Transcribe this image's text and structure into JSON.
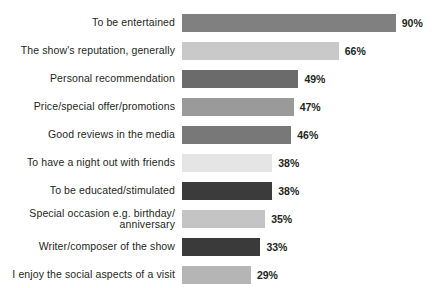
{
  "chart": {
    "title": "",
    "subtitle": "",
    "axis_suffix": "%"
  },
  "chart_data": {
    "type": "bar",
    "orientation": "horizontal",
    "title": "",
    "xlabel": "",
    "ylabel": "",
    "xlim": [
      0,
      100
    ],
    "grid": false,
    "legend": "none",
    "value_suffix": "%",
    "categories": [
      "To be entertained",
      "The show's reputation, generally",
      "Personal recommendation",
      "Price/special offer/promotions",
      "Good reviews in the media",
      "To have a night out with friends",
      "To be educated/stimulated",
      "Special occasion e.g. birthday/\nanniversary",
      "Writer/composer of the show",
      "I enjoy the social aspects of a visit"
    ],
    "values": [
      90,
      66,
      49,
      47,
      46,
      38,
      38,
      35,
      33,
      29
    ],
    "value_labels": [
      "90%",
      "66%",
      "49%",
      "47%",
      "46%",
      "38%",
      "38%",
      "35%",
      "33%",
      "29%"
    ],
    "bar_colors": [
      "#808080",
      "#c9c9c9",
      "#6b6b6b",
      "#9a9a9a",
      "#787878",
      "#e5e5e5",
      "#3b3b3b",
      "#c4c4c4",
      "#3a3a3a",
      "#b5b5b5"
    ]
  },
  "style": {
    "background": "#ffffff",
    "text_color": "#231f20",
    "px_per_percent": 2.375
  }
}
